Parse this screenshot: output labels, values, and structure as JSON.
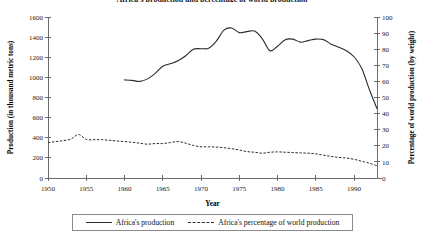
{
  "chart_data": {
    "type": "line",
    "title": "Africa's production and percentage of world production",
    "xlabel": "Year",
    "ylabel": "Production (in thousand metric tons)",
    "y2label": "Percentage of world production (by weight)",
    "xlim": [
      1950,
      1993
    ],
    "ylim": [
      0,
      1600
    ],
    "y2lim": [
      0,
      100
    ],
    "xticks": [
      1950,
      1955,
      1960,
      1965,
      1970,
      1975,
      1980,
      1985,
      1990
    ],
    "yticks": [
      0,
      200,
      400,
      600,
      800,
      1000,
      1200,
      1400,
      1600
    ],
    "y2ticks": [
      0,
      10,
      20,
      30,
      40,
      50,
      60,
      70,
      80,
      90,
      100
    ],
    "grid": false,
    "legend_position": "bottom",
    "series": [
      {
        "name": "Africa's production",
        "style": "solid",
        "axis": "left",
        "units": "thousand metric tons",
        "x": [
          1960,
          1961,
          1962,
          1963,
          1964,
          1965,
          1966,
          1967,
          1968,
          1969,
          1970,
          1971,
          1972,
          1973,
          1974,
          1975,
          1976,
          1977,
          1978,
          1979,
          1980,
          1981,
          1982,
          1983,
          1984,
          1985,
          1986,
          1987,
          1988,
          1989,
          1990,
          1991,
          1992,
          1993
        ],
        "values": [
          975,
          970,
          960,
          985,
          1040,
          1110,
          1135,
          1165,
          1215,
          1280,
          1285,
          1290,
          1360,
          1470,
          1490,
          1445,
          1455,
          1460,
          1385,
          1265,
          1310,
          1375,
          1380,
          1350,
          1365,
          1380,
          1375,
          1330,
          1300,
          1265,
          1205,
          1090,
          880,
          690
        ]
      },
      {
        "name": "Africa's percentage of world production",
        "style": "dashed",
        "axis": "right",
        "units": "percent by weight",
        "x": [
          1950,
          1951,
          1952,
          1953,
          1954,
          1955,
          1956,
          1957,
          1958,
          1959,
          1960,
          1961,
          1962,
          1963,
          1964,
          1965,
          1966,
          1967,
          1968,
          1969,
          1970,
          1971,
          1972,
          1973,
          1974,
          1975,
          1976,
          1977,
          1978,
          1979,
          1980,
          1981,
          1982,
          1983,
          1984,
          1985,
          1986,
          1987,
          1988,
          1989,
          1990,
          1991,
          1992,
          1993
        ],
        "values": [
          22.0,
          22.6,
          23.2,
          24.2,
          27.0,
          24.0,
          23.8,
          23.8,
          23.4,
          23.0,
          22.6,
          22.2,
          21.6,
          21.0,
          21.4,
          21.4,
          22.0,
          22.6,
          21.6,
          20.2,
          19.4,
          19.4,
          19.2,
          18.8,
          18.2,
          17.4,
          16.4,
          16.0,
          15.4,
          16.0,
          16.2,
          16.0,
          15.8,
          15.6,
          15.4,
          15.0,
          14.2,
          13.4,
          12.8,
          12.4,
          11.6,
          10.4,
          9.2,
          7.6
        ]
      }
    ]
  }
}
